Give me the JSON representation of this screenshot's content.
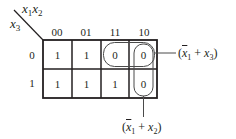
{
  "diagram": {
    "type": "karnaugh-map",
    "variables": {
      "column_vars": "x1x2",
      "row_var": "x3"
    },
    "column_headers": [
      "00",
      "01",
      "11",
      "10"
    ],
    "row_headers": [
      "0",
      "1"
    ],
    "cells": [
      [
        "1",
        "1",
        "0",
        "0"
      ],
      [
        "1",
        "1",
        "1",
        "0"
      ]
    ],
    "groups": [
      {
        "name": "row-group",
        "expression": "(x̄1 + x3)",
        "covers": [
          [
            0,
            2
          ],
          [
            0,
            3
          ]
        ]
      },
      {
        "name": "column-group",
        "expression": "(x̄1 + x2)",
        "covers": [
          [
            0,
            3
          ],
          [
            1,
            3
          ]
        ]
      }
    ],
    "labels": {
      "col_var_main": "x",
      "col_var_sub1": "1",
      "col_var_mid": "x",
      "col_var_sub2": "2",
      "row_var_main": "x",
      "row_var_sub": "3",
      "group1_open": "(",
      "group1_var1": "x",
      "group1_sub1": "1",
      "group1_op": " + ",
      "group1_var2": "x",
      "group1_sub2": "3",
      "group1_close": ")",
      "group2_open": "(",
      "group2_var1": "x",
      "group2_sub1": "1",
      "group2_op": " + ",
      "group2_var2": "x",
      "group2_sub2": "2",
      "group2_close": ")"
    },
    "colors": {
      "line": "#231f20",
      "loop": "#4a4a4a",
      "background": "#ffffff"
    }
  }
}
